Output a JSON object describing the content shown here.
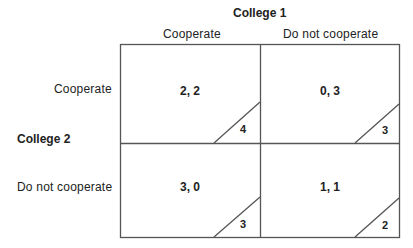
{
  "diagram": {
    "column_player": "College 1",
    "row_player": "College 2",
    "columns": [
      "Cooperate",
      "Do not cooperate"
    ],
    "rows": [
      "Cooperate",
      "Do not cooperate"
    ],
    "cells": [
      [
        {
          "payoffs": "2, 2",
          "total": "4"
        },
        {
          "payoffs": "0, 3",
          "total": "3"
        }
      ],
      [
        {
          "payoffs": "3, 0",
          "total": "3"
        },
        {
          "payoffs": "1, 1",
          "total": "2"
        }
      ]
    ],
    "line_color": "#555555",
    "text_color": "#222222"
  }
}
